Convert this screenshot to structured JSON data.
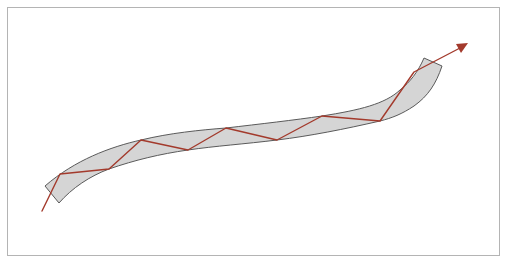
{
  "figure": {
    "colors": {
      "frame_border": "#b4b4b4",
      "fiber_fill": "#d5d5d5",
      "fiber_outline": "#5a5a5a",
      "ray": "#a33a2c",
      "background": "#ffffff"
    },
    "fiber": {
      "shape": "S-shaped curved waveguide with straight end caps",
      "top_edge": [
        [
          45,
          185
        ],
        [
          60,
          174
        ],
        [
          141,
          140
        ],
        [
          226,
          128
        ],
        [
          322,
          116
        ],
        [
          424,
          58
        ]
      ],
      "bottom_edge": [
        [
          59,
          203
        ],
        [
          109,
          169
        ],
        [
          188,
          150
        ],
        [
          277,
          140
        ],
        [
          380,
          120
        ],
        [
          442,
          66
        ]
      ]
    },
    "ray": {
      "start": [
        42,
        211
      ],
      "reflection_points": [
        [
          60,
          174
        ],
        [
          109,
          169
        ],
        [
          141,
          140
        ],
        [
          188,
          150
        ],
        [
          226,
          128
        ],
        [
          277,
          140
        ],
        [
          322,
          116
        ],
        [
          380,
          120
        ],
        [
          414,
          72
        ]
      ],
      "end_arrow_tip": [
        467,
        44
      ],
      "icon": "arrow-icon"
    }
  }
}
